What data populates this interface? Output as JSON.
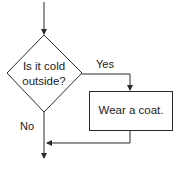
{
  "diagram": {
    "type": "flowchart",
    "decision": {
      "line1": "Is it cold",
      "line2": "outside?"
    },
    "process": {
      "label": "Wear a coat."
    },
    "edges": {
      "yes_label": "Yes",
      "no_label": "No"
    },
    "colors": {
      "stroke": "#2a2a2a",
      "text": "#222222",
      "background": "#ffffff"
    }
  }
}
